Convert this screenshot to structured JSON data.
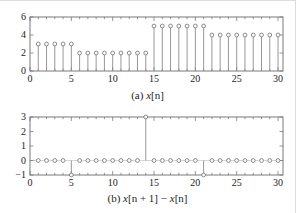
{
  "figure": {
    "background": "#ffffff",
    "axis_color": "#6b6b6b",
    "stem_color": "#8c8c8c",
    "marker_edge_color": "#6e6e6e",
    "marker_fill": "#ffffff",
    "text_color": "#1c1c1c"
  },
  "panel_a": {
    "caption_prefix": "(a)",
    "caption_var": "x",
    "caption_index": "[n]",
    "caption_full": "(a) x[n]"
  },
  "panel_b": {
    "caption_prefix": "(b)",
    "caption_var1": "x",
    "caption_index1": "[n + 1]",
    "caption_minus": "−",
    "caption_var2": "x",
    "caption_index2": "[n]",
    "caption_full": "(b) x[n + 1] − x[n]"
  },
  "chart_data": [
    {
      "type": "line",
      "plot_style": "stem",
      "title": "(a) x[n]",
      "xlabel": "",
      "ylabel": "",
      "xlim": [
        0,
        30.6
      ],
      "ylim": [
        0,
        6
      ],
      "xticks": [
        0,
        5,
        10,
        15,
        20,
        25,
        30
      ],
      "xticklabels": [
        "0",
        "5",
        "10",
        "15",
        "20",
        "25",
        "30"
      ],
      "yticks": [
        0,
        2,
        4,
        6
      ],
      "yticklabels": [
        "0",
        "2",
        "4",
        "6"
      ],
      "minor_xticks_step": 1,
      "grid": false,
      "legend": null,
      "x": [
        1,
        2,
        3,
        4,
        5,
        6,
        7,
        8,
        9,
        10,
        11,
        12,
        13,
        14,
        15,
        16,
        17,
        18,
        19,
        20,
        21,
        22,
        23,
        24,
        25,
        26,
        27,
        28,
        29,
        30
      ],
      "values": [
        3,
        3,
        3,
        3,
        3,
        2,
        2,
        2,
        2,
        2,
        2,
        2,
        2,
        2,
        5,
        5,
        5,
        5,
        5,
        5,
        5,
        4,
        4,
        4,
        4,
        4,
        4,
        4,
        4,
        4
      ]
    },
    {
      "type": "line",
      "plot_style": "stem",
      "title": "(b) x[n + 1] − x[n]",
      "xlabel": "",
      "ylabel": "",
      "xlim": [
        0,
        30.6
      ],
      "ylim": [
        -1,
        3
      ],
      "xticks": [
        0,
        5,
        10,
        15,
        20,
        25,
        30
      ],
      "xticklabels": [
        "0",
        "5",
        "10",
        "15",
        "20",
        "25",
        "30"
      ],
      "yticks": [
        -1,
        0,
        1,
        2,
        3
      ],
      "yticklabels": [
        "−1",
        "0",
        "1",
        "2",
        "3"
      ],
      "minor_xticks_step": 1,
      "grid": false,
      "legend": null,
      "x": [
        1,
        2,
        3,
        4,
        5,
        6,
        7,
        8,
        9,
        10,
        11,
        12,
        13,
        14,
        15,
        16,
        17,
        18,
        19,
        20,
        21,
        22,
        23,
        24,
        25,
        26,
        27,
        28,
        29,
        30
      ],
      "values": [
        0,
        0,
        0,
        0,
        -1,
        0,
        0,
        0,
        0,
        0,
        0,
        0,
        0,
        3,
        0,
        0,
        0,
        0,
        0,
        0,
        -1,
        0,
        0,
        0,
        0,
        0,
        0,
        0,
        0,
        0
      ]
    }
  ]
}
